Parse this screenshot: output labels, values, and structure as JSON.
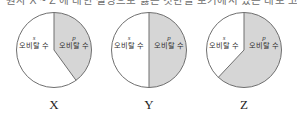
{
  "header": {
    "cut_off_text": "원자 X ~ Z 에 대한 설명으로 옳은 것만을 보기에서 있는 대로 고른 것은?"
  },
  "style": {
    "p_slice_color": "#d6d6d6",
    "s_slice_color": "#ffffff",
    "outline_color": "#6f6f6f",
    "text_color": "#2b2b2b"
  },
  "charts": [
    {
      "caption": "X",
      "left_label": {
        "symbol": "s",
        "text": "오비탈 수"
      },
      "right_label": {
        "symbol": "p",
        "text": "오비탈 수"
      },
      "p_percent": 40,
      "s_percent": 60
    },
    {
      "caption": "Y",
      "left_label": {
        "symbol": "s",
        "text": "오비탈 수"
      },
      "right_label": {
        "symbol": "p",
        "text": "오비탈 수"
      },
      "p_percent": 50,
      "s_percent": 50
    },
    {
      "caption": "Z",
      "left_label": {
        "symbol": "s",
        "text": "오비탈 수"
      },
      "right_label": {
        "symbol": "p",
        "text": "오비탈 수"
      },
      "p_percent": 62,
      "s_percent": 38
    }
  ],
  "chart_data": {
    "type": "pie",
    "title": "",
    "subtitle": "",
    "legend_position": "inside-slices",
    "grid": false,
    "categories": [
      "s 오비탈 수",
      "p 오비탈 수"
    ],
    "charts": [
      {
        "name": "X",
        "labels": [
          "s 오비탈 수",
          "p 오비탈 수"
        ],
        "values": [
          60,
          40
        ],
        "units": "percent",
        "start_angle_deg": 0,
        "direction": "clockwise",
        "colors": [
          "#ffffff",
          "#d6d6d6"
        ]
      },
      {
        "name": "Y",
        "labels": [
          "s 오비탈 수",
          "p 오비탈 수"
        ],
        "values": [
          50,
          50
        ],
        "units": "percent",
        "start_angle_deg": 0,
        "direction": "clockwise",
        "colors": [
          "#ffffff",
          "#d6d6d6"
        ]
      },
      {
        "name": "Z",
        "labels": [
          "s 오비탈 수",
          "p 오비탈 수"
        ],
        "values": [
          38,
          62
        ],
        "units": "percent",
        "start_angle_deg": 0,
        "direction": "clockwise",
        "colors": [
          "#ffffff",
          "#d6d6d6"
        ]
      }
    ],
    "xlabel": "",
    "ylabel": ""
  }
}
